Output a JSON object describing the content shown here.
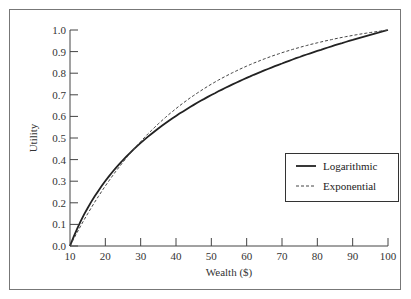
{
  "chart_data": {
    "type": "line",
    "title": "",
    "xlabel": "Wealth ($)",
    "ylabel": "Utility",
    "xlim": [
      10,
      100
    ],
    "ylim": [
      0.0,
      1.0
    ],
    "x_ticks": [
      10,
      20,
      30,
      40,
      50,
      60,
      70,
      80,
      90,
      100
    ],
    "y_ticks": [
      "0.0",
      "0.1",
      "0.2",
      "0.3",
      "0.4",
      "0.5",
      "0.6",
      "0.7",
      "0.8",
      "0.9",
      "1.0"
    ],
    "grid": false,
    "legend_position": "center-right",
    "x": [
      10,
      15,
      20,
      25,
      30,
      35,
      40,
      45,
      50,
      55,
      60,
      65,
      70,
      75,
      80,
      85,
      90,
      95,
      100
    ],
    "series": [
      {
        "name": "Logarithmic",
        "style": "solid",
        "values": [
          0.0,
          0.176,
          0.301,
          0.398,
          0.477,
          0.544,
          0.602,
          0.653,
          0.699,
          0.74,
          0.778,
          0.813,
          0.845,
          0.875,
          0.903,
          0.929,
          0.954,
          0.978,
          1.0
        ]
      },
      {
        "name": "Exponential",
        "style": "dashed",
        "values": [
          0.0,
          0.15,
          0.278,
          0.388,
          0.483,
          0.564,
          0.634,
          0.694,
          0.746,
          0.79,
          0.828,
          0.861,
          0.889,
          0.913,
          0.933,
          0.951,
          0.966,
          0.979,
          1.0
        ]
      }
    ]
  },
  "legend": {
    "items": [
      {
        "label": "Logarithmic"
      },
      {
        "label": "Exponential"
      }
    ]
  }
}
